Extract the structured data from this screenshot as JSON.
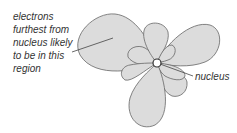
{
  "labels": {
    "electrons_region": [
      "electrons",
      "furthest from",
      "nucleus likely",
      "to be in this",
      "region"
    ],
    "nucleus": "nucleus"
  },
  "colors": {
    "lobe_fill": "#dcdcdc",
    "lobe_stroke": "#666666",
    "text": "#333333",
    "nucleus_fill": "#ffffff"
  }
}
